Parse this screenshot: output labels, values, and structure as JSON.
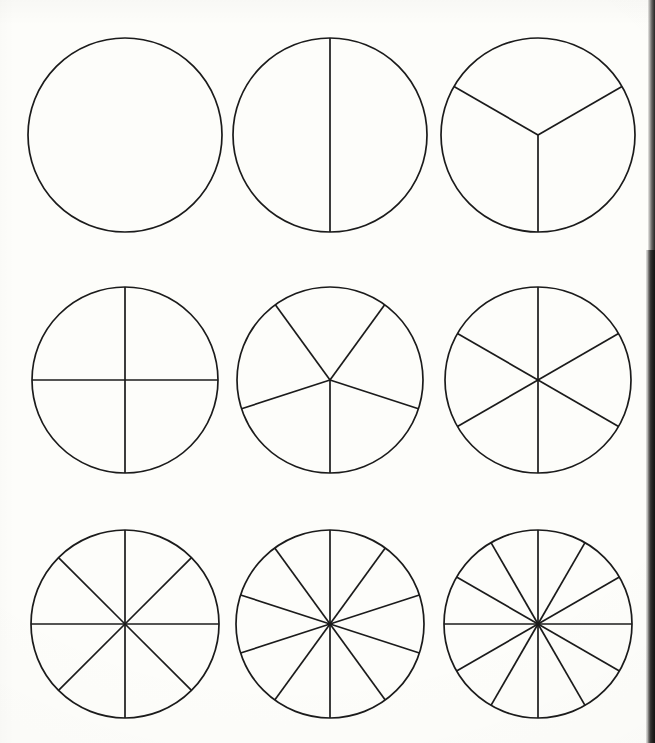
{
  "page": {
    "background_color": "#fdfdfa",
    "line_color": "#1b1b1b",
    "line_width": 1.7,
    "width": 655,
    "height": 743,
    "rows": 3,
    "columns": 3,
    "has_labels": false,
    "page_edge_artifact": true
  },
  "chart_data": {
    "type": "pie",
    "xlabel": "",
    "ylabel": "",
    "grid": false,
    "legend_position": "none",
    "layout": {
      "rows": 3,
      "columns": 3,
      "column_centers_x": [
        125,
        330,
        538
      ],
      "row_centers_y": [
        135,
        380,
        624
      ],
      "radii_by_row": [
        97,
        93,
        94
      ]
    },
    "figures": [
      {
        "index": 1,
        "name": "whole",
        "fraction_label": "1/1",
        "sectors": 1,
        "cx": 125,
        "cy": 135,
        "r": 97,
        "start_angle_deg": -90,
        "sector_angle_deg": 360,
        "spoke_angles_deg": [],
        "values": [
          1
        ]
      },
      {
        "index": 2,
        "name": "halves",
        "fraction_label": "1/2",
        "sectors": 2,
        "cx": 330,
        "cy": 135,
        "r": 97,
        "start_angle_deg": -90,
        "sector_angle_deg": 180,
        "spoke_angles_deg": [
          -90,
          90
        ],
        "values": [
          1,
          1
        ]
      },
      {
        "index": 3,
        "name": "thirds",
        "fraction_label": "1/3",
        "sectors": 3,
        "cx": 538,
        "cy": 135,
        "r": 97,
        "start_angle_deg": 90,
        "sector_angle_deg": 120,
        "spoke_angles_deg": [
          90,
          210,
          330
        ],
        "values": [
          1,
          1,
          1
        ]
      },
      {
        "index": 4,
        "name": "quarters",
        "fraction_label": "1/4",
        "sectors": 4,
        "cx": 125,
        "cy": 380,
        "r": 93,
        "start_angle_deg": -90,
        "sector_angle_deg": 90,
        "spoke_angles_deg": [
          -90,
          0,
          90,
          180
        ],
        "values": [
          1,
          1,
          1,
          1
        ]
      },
      {
        "index": 5,
        "name": "fifths",
        "fraction_label": "1/5",
        "sectors": 5,
        "cx": 330,
        "cy": 380,
        "r": 93,
        "start_angle_deg": 90,
        "sector_angle_deg": 72,
        "spoke_angles_deg": [
          90,
          162,
          234,
          306,
          18
        ],
        "values": [
          1,
          1,
          1,
          1,
          1
        ]
      },
      {
        "index": 6,
        "name": "sixths",
        "fraction_label": "1/6",
        "sectors": 6,
        "cx": 538,
        "cy": 380,
        "r": 93,
        "start_angle_deg": -90,
        "sector_angle_deg": 60,
        "spoke_angles_deg": [
          -90,
          -30,
          30,
          90,
          150,
          210
        ],
        "values": [
          1,
          1,
          1,
          1,
          1,
          1
        ]
      },
      {
        "index": 7,
        "name": "eighths",
        "fraction_label": "1/8",
        "sectors": 8,
        "cx": 125,
        "cy": 624,
        "r": 94,
        "start_angle_deg": -90,
        "sector_angle_deg": 45,
        "spoke_angles_deg": [
          -90,
          -45,
          0,
          45,
          90,
          135,
          180,
          225
        ],
        "values": [
          1,
          1,
          1,
          1,
          1,
          1,
          1,
          1
        ]
      },
      {
        "index": 8,
        "name": "tenths",
        "fraction_label": "1/10",
        "sectors": 10,
        "cx": 330,
        "cy": 624,
        "r": 94,
        "start_angle_deg": -90,
        "sector_angle_deg": 36,
        "spoke_angles_deg": [
          -90,
          -54,
          -18,
          18,
          54,
          90,
          126,
          162,
          198,
          234
        ],
        "values": [
          1,
          1,
          1,
          1,
          1,
          1,
          1,
          1,
          1,
          1
        ]
      },
      {
        "index": 9,
        "name": "twelfths",
        "fraction_label": "1/12",
        "sectors": 12,
        "cx": 538,
        "cy": 624,
        "r": 94,
        "start_angle_deg": -90,
        "sector_angle_deg": 30,
        "spoke_angles_deg": [
          -90,
          -60,
          -30,
          0,
          30,
          60,
          90,
          120,
          150,
          180,
          210,
          240
        ],
        "values": [
          1,
          1,
          1,
          1,
          1,
          1,
          1,
          1,
          1,
          1,
          1,
          1
        ]
      }
    ]
  }
}
